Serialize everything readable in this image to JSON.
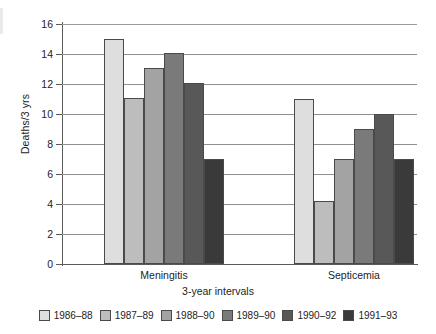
{
  "chart_data": {
    "type": "bar",
    "title": "",
    "xlabel": "3-year intervals",
    "ylabel": "Deaths/3 yrs",
    "ylim": [
      0,
      16
    ],
    "ytick_step": 2,
    "yticks": [
      16,
      14,
      12,
      10,
      8,
      6,
      4,
      2,
      0
    ],
    "grid": true,
    "legend_position": "bottom",
    "categories": [
      "Meningitis",
      "Septicemia"
    ],
    "series": [
      {
        "name": "1986–88",
        "color": "#dedede",
        "values": [
          15.0,
          11.0
        ]
      },
      {
        "name": "1987–89",
        "color": "#bdbdbd",
        "values": [
          11.1,
          4.2
        ]
      },
      {
        "name": "1988–90",
        "color": "#a3a3a3",
        "values": [
          13.1,
          7.0
        ]
      },
      {
        "name": "1989–90",
        "color": "#7a7a7a",
        "values": [
          14.1,
          9.0
        ]
      },
      {
        "name": "1990–92",
        "color": "#585858",
        "values": [
          12.1,
          10.0
        ]
      },
      {
        "name": "1991–93",
        "color": "#3a3a3a",
        "values": [
          7.0,
          7.0
        ]
      }
    ]
  },
  "axis": {
    "y_title": "Deaths/3 yrs",
    "x_title": "3-year intervals",
    "y_tick_labels": [
      "16",
      "14",
      "12",
      "10",
      "8",
      "6",
      "4",
      "2",
      "0"
    ],
    "category_labels": [
      "Meningitis",
      "Septicemia"
    ]
  },
  "legend": {
    "entries": [
      {
        "label": "1986–88",
        "color": "#dedede"
      },
      {
        "label": "1987–89",
        "color": "#bdbdbd"
      },
      {
        "label": "1988–90",
        "color": "#a3a3a3"
      },
      {
        "label": "1989–90",
        "color": "#7a7a7a"
      },
      {
        "label": "1990–92",
        "color": "#585858"
      },
      {
        "label": "1991–93",
        "color": "#3a3a3a"
      }
    ]
  }
}
